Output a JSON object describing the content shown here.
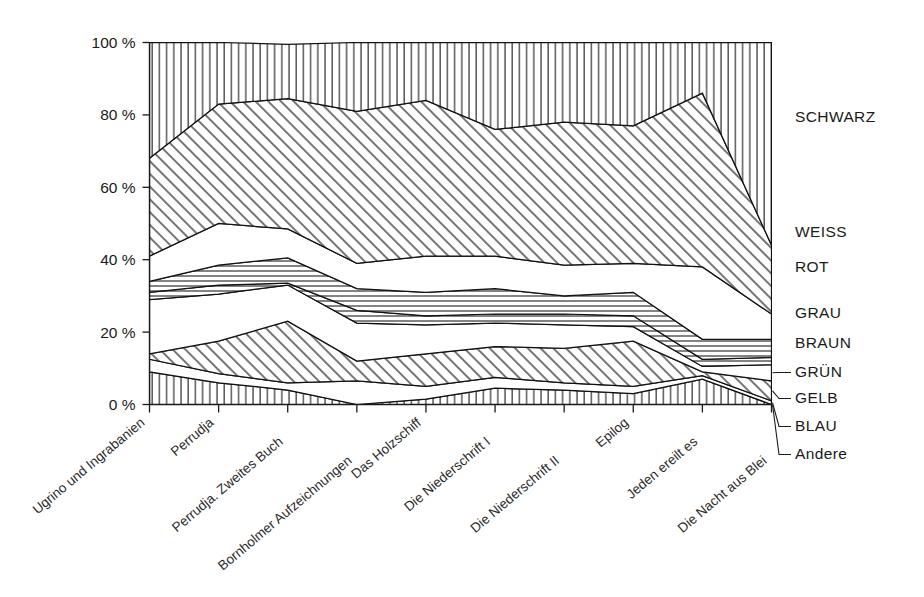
{
  "chart_data": {
    "type": "area",
    "title": "",
    "subtitle": "",
    "xlabel": "",
    "ylabel": "",
    "stacked": true,
    "stack_mode": "percent",
    "grid": false,
    "legend_position": "right",
    "ylim": [
      0,
      100
    ],
    "ytick_labels": [
      "0 %",
      "20 %",
      "40 %",
      "60 %",
      "80 %",
      "100 %"
    ],
    "ytick_values": [
      0,
      20,
      40,
      60,
      80,
      100
    ],
    "categories": [
      "Ugrino und Ingrabanien",
      "Perrudja",
      "Perrudja. Zweites Buch",
      "Bornholmer Aufzeichnungen",
      "Das Holzschiff",
      "Die Niederschrift I",
      "Die Niederschrift II",
      "Epilog",
      "Jeden ereilt es",
      "Die Nacht aus Blei"
    ],
    "series": [
      {
        "name": "Andere",
        "pattern": "vertical-hatch",
        "values": [
          9.0,
          6.0,
          4.0,
          0.0,
          1.5,
          4.5,
          4.0,
          3.0,
          7.0,
          0.0
        ]
      },
      {
        "name": "BLAU",
        "pattern": "blank",
        "values": [
          3.5,
          2.5,
          2.0,
          6.5,
          3.5,
          3.0,
          2.0,
          2.0,
          1.0,
          1.0
        ]
      },
      {
        "name": "GELB",
        "pattern": "diagonal-hatch",
        "values": [
          1.5,
          9.0,
          17.0,
          5.5,
          9.0,
          8.5,
          9.5,
          12.5,
          1.0,
          5.5
        ]
      },
      {
        "name": "GRÜN",
        "pattern": "blank",
        "values": [
          15.0,
          13.0,
          10.0,
          10.5,
          8.0,
          6.5,
          6.5,
          4.0,
          1.5,
          4.5
        ]
      },
      {
        "name": "BRAUN",
        "pattern": "horizontal-hatch",
        "values": [
          2.0,
          2.5,
          0.5,
          3.5,
          2.5,
          2.5,
          3.0,
          3.0,
          2.0,
          2.0
        ]
      },
      {
        "name": "GRAU",
        "pattern": "horizontal-hatch",
        "values": [
          3.0,
          5.5,
          7.0,
          6.0,
          6.5,
          7.0,
          5.0,
          6.5,
          5.5,
          5.0
        ]
      },
      {
        "name": "ROT",
        "pattern": "blank",
        "values": [
          7.0,
          11.5,
          8.0,
          7.0,
          10.0,
          9.0,
          8.5,
          8.0,
          20.0,
          7.0
        ]
      },
      {
        "name": "WEISS",
        "pattern": "diagonal-hatch",
        "values": [
          27.0,
          33.0,
          36.0,
          42.0,
          43.0,
          35.0,
          39.5,
          38.0,
          48.0,
          19.0
        ]
      },
      {
        "name": "SCHWARZ",
        "pattern": "vertical-hatch",
        "values": [
          32.0,
          17.0,
          15.0,
          19.0,
          16.0,
          24.0,
          22.0,
          23.0,
          14.0,
          56.0
        ]
      }
    ]
  },
  "legend": {
    "items": [
      {
        "label": "SCHWARZ"
      },
      {
        "label": "WEISS"
      },
      {
        "label": "ROT"
      },
      {
        "label": "GRAU"
      },
      {
        "label": "BRAUN"
      },
      {
        "label": "GRÜN"
      },
      {
        "label": "GELB"
      },
      {
        "label": "BLAU"
      },
      {
        "label": "Andere"
      }
    ]
  }
}
